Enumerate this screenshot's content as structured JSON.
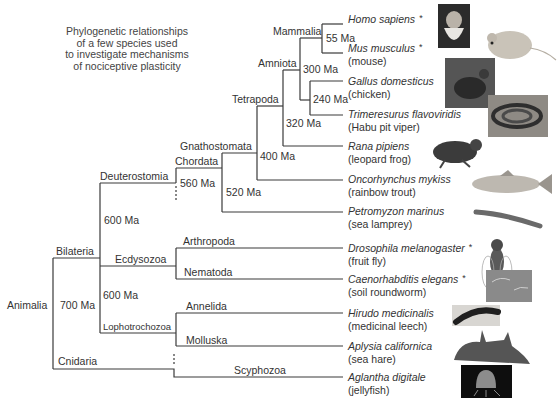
{
  "title_lines": [
    "Phylogenetic relationships",
    "of a few species used",
    "to investigate mechanisms",
    "of nociceptive plasticity"
  ],
  "clades": {
    "animalia": "Animalia",
    "bilateria": "Bilateria",
    "cnidaria": "Cnidaria",
    "deuterostomia": "Deuterostomia",
    "ecdysozoa": "Ecdysozoa",
    "lophotrochozoa": "Lophotrochozoa",
    "chordata": "Chordata",
    "gnathostomata": "Gnathostomata",
    "tetrapoda": "Tetrapoda",
    "amniota": "Amniota",
    "mammalia": "Mammalia",
    "arthropoda": "Arthropoda",
    "nematoda": "Nematoda",
    "annelida": "Annelida",
    "molluska": "Molluska",
    "scyphozoa": "Scyphozoa"
  },
  "ages": {
    "animalia": "700 Ma",
    "deuterostomia": "600 Ma",
    "protostomia": "600 Ma",
    "chordata": "560 Ma",
    "gnathostomata": "520 Ma",
    "tetrapoda": "400 Ma",
    "amniota": "320 Ma",
    "mammalia": "300 Ma",
    "sauropsida": "240 Ma",
    "primates_rodents": "55 Ma"
  },
  "species": [
    {
      "scientific": "Homo sapiens",
      "common": "",
      "starred": true,
      "image": "human-portrait"
    },
    {
      "scientific": "Mus musculus",
      "common": "(mouse)",
      "starred": true,
      "image": "mouse"
    },
    {
      "scientific": "Gallus domesticus",
      "common": "(chicken)",
      "starred": false,
      "image": "chicken"
    },
    {
      "scientific": "Trimeresurus flavoviridis",
      "common": "(Habu pit viper)",
      "starred": false,
      "image": "snake"
    },
    {
      "scientific": "Rana pipiens",
      "common": "(leopard frog)",
      "starred": false,
      "image": "frog"
    },
    {
      "scientific": "Oncorhynchus mykiss",
      "common": "(rainbow trout)",
      "starred": false,
      "image": "trout"
    },
    {
      "scientific": "Petromyzon marinus",
      "common": "(sea lamprey)",
      "starred": false,
      "image": "lamprey"
    },
    {
      "scientific": "Drosophila melanogaster",
      "common": "(fruit fly)",
      "starred": true,
      "image": "fly"
    },
    {
      "scientific": "Caenorhabditis elegans",
      "common": "(soil roundworm)",
      "starred": true,
      "image": "worm"
    },
    {
      "scientific": "Hirudo medicinalis",
      "common": "(medicinal leech)",
      "starred": false,
      "image": "leech"
    },
    {
      "scientific": "Aplysia californica",
      "common": "(sea hare)",
      "starred": false,
      "image": "sea-hare"
    },
    {
      "scientific": "Aglantha digitale",
      "common": "(jellyfish)",
      "starred": false,
      "image": "jellyfish"
    }
  ],
  "star_symbol": "*",
  "colors": {
    "line": "#3a3a3a",
    "text": "#333333"
  }
}
